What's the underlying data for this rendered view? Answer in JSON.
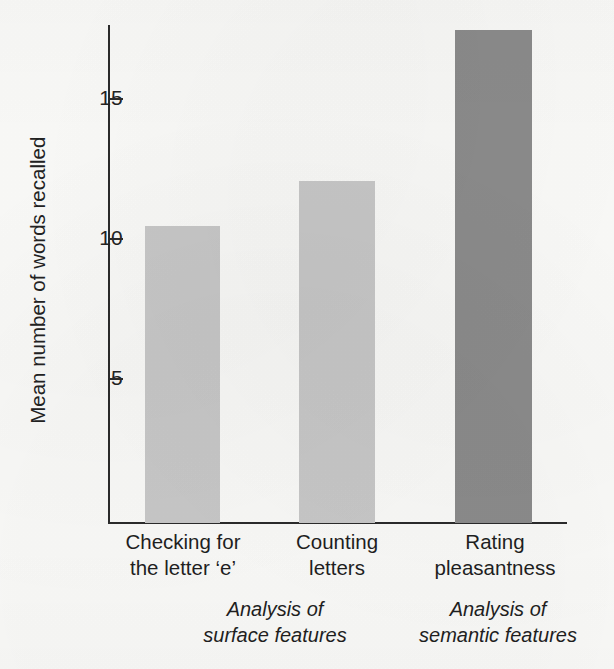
{
  "chart_data": {
    "type": "bar",
    "title": "",
    "xlabel": "",
    "ylabel": "Mean number of words recalled",
    "categories": [
      "Checking for\nthe letter ‘e’",
      "Counting\nletters",
      "Rating\npleasantness"
    ],
    "values": [
      10.6,
      12.2,
      17.6
    ],
    "bar_colors": [
      "#c9c9c9",
      "#c9c9c9",
      "#8c8c8c"
    ],
    "ylim": [
      0,
      18.5
    ],
    "yticks": [
      5,
      10,
      15
    ],
    "ytick_labels": [
      "5",
      "10",
      "15"
    ],
    "grid": false,
    "legend": null,
    "annotations": [
      {
        "text": "Analysis of\nsurface features",
        "style": "italic",
        "spans_categories": [
          0,
          1
        ]
      },
      {
        "text": "Analysis of\nsemantic features",
        "style": "italic",
        "spans_categories": [
          2
        ]
      }
    ]
  },
  "axis": {
    "line_color": "#2b2b2b",
    "tick_color": "#2b2b2b"
  },
  "background": {
    "color": "#fbfbf9"
  }
}
